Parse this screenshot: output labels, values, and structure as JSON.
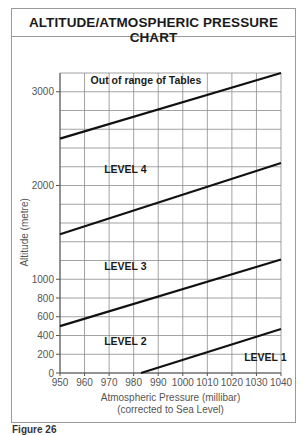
{
  "title": "ALTITUDE/ATMOSPHERIC PRESSURE CHART",
  "figure_label": "Figure 26",
  "chart_data": {
    "type": "line",
    "title": "ALTITUDE/ATMOSPHERIC PRESSURE CHART",
    "xlabel": "Atmospheric Pressure (millibar)",
    "xlabel_sub": "(corrected to Sea Level)",
    "ylabel": "Altitude (metre)",
    "xlim": [
      950,
      1040
    ],
    "ylim": [
      0,
      3200
    ],
    "x_ticks": [
      950,
      960,
      970,
      980,
      990,
      1000,
      1010,
      1020,
      1030,
      1040
    ],
    "y_ticks": [
      0,
      200,
      400,
      600,
      800,
      1000,
      2000,
      3000
    ],
    "grid": true,
    "grid_x_step": 10,
    "grid_y_step": 200,
    "series": [
      {
        "name": "Level 1/2 boundary",
        "x": [
          983,
          1040
        ],
        "y": [
          0,
          470
        ]
      },
      {
        "name": "Level 2/3 boundary",
        "x": [
          950,
          1040
        ],
        "y": [
          500,
          1210
        ]
      },
      {
        "name": "Level 3/4 boundary",
        "x": [
          950,
          1040
        ],
        "y": [
          1480,
          2240
        ]
      },
      {
        "name": "Level 4 / Out of range boundary",
        "x": [
          950,
          1040
        ],
        "y": [
          2500,
          3200
        ]
      }
    ],
    "regions": [
      {
        "label": "LEVEL 1",
        "x": 1025,
        "y": 130
      },
      {
        "label": "LEVEL 2",
        "x": 968,
        "y": 300
      },
      {
        "label": "LEVEL 3",
        "x": 968,
        "y": 1100
      },
      {
        "label": "LEVEL 4",
        "x": 968,
        "y": 2130
      },
      {
        "label": "Out of range of Tables",
        "x": 985,
        "y": 3080
      }
    ]
  }
}
